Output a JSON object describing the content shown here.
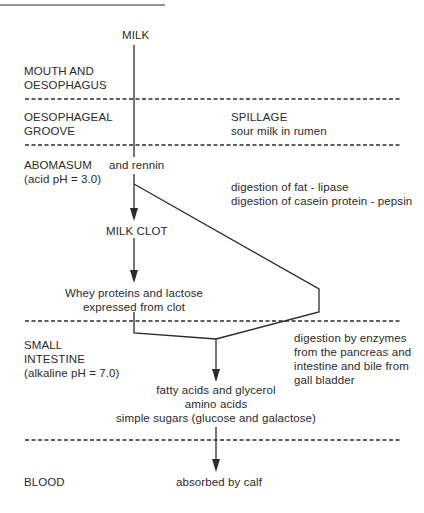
{
  "diagram": {
    "start_label": "MILK",
    "zones": [
      {
        "id": "mouth",
        "label_lines": [
          "MOUTH AND",
          "OESOPHAGUS"
        ]
      },
      {
        "id": "groove",
        "label_lines": [
          "OESOPHAGEAL",
          "GROOVE"
        ],
        "side_title": "SPILLAGE",
        "side_note": "sour milk in rumen"
      },
      {
        "id": "abomasum",
        "label_lines": [
          "ABOMASUM",
          "(acid pH = 3.0)"
        ],
        "flow_note": "and rennin",
        "side_notes": [
          "digestion of fat - lipase",
          "digestion of casein protein - pepsin"
        ]
      },
      {
        "id": "small_intestine",
        "label_lines": [
          "SMALL",
          "INTESTINE",
          "(alkaline pH = 7.0)"
        ],
        "side_notes": [
          "digestion by enzymes",
          "from the pancreas and",
          "intestine and bile from",
          "gall bladder"
        ]
      },
      {
        "id": "blood",
        "label_lines": [
          "BLOOD"
        ],
        "outcome": "absorbed by calf"
      }
    ],
    "nodes": {
      "milk_clot": "MILK CLOT",
      "whey": [
        "Whey proteins and lactose",
        "expressed from clot"
      ],
      "products": [
        "fatty acids and glycerol",
        "amino acids",
        "simple sugars (glucose and galactose)"
      ]
    },
    "colors": {
      "line": "#2a2a2a",
      "text": "#2a2a2a",
      "background": "#ffffff"
    }
  }
}
